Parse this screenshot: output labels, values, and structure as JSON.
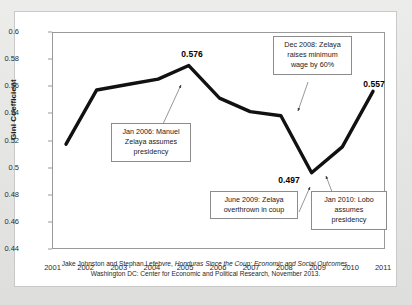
{
  "chart_data": {
    "type": "line",
    "title": "",
    "xlabel": "",
    "ylabel": "Gini Coefficient",
    "x": [
      2001,
      2002,
      2003,
      2004,
      2005,
      2006,
      2007,
      2008,
      2009,
      2010,
      2011
    ],
    "categories": [
      "2001",
      "2002",
      "2003",
      "2004",
      "2005",
      "2006",
      "2007",
      "2008",
      "2009",
      "2010",
      "2011"
    ],
    "values": [
      0.518,
      0.558,
      0.562,
      0.566,
      0.576,
      0.552,
      0.542,
      0.539,
      0.497,
      0.516,
      0.557
    ],
    "series": [
      {
        "name": "Gini Coefficient",
        "values": [
          0.518,
          0.558,
          0.562,
          0.566,
          0.576,
          0.552,
          0.542,
          0.539,
          0.497,
          0.516,
          0.557
        ]
      }
    ],
    "ylim": [
      0.44,
      0.6
    ],
    "xlim": [
      2001,
      2011
    ],
    "ytick_labels": [
      "0.6",
      "0.58",
      "0.56",
      "0.54",
      "0.52",
      "0.5",
      "0.48",
      "0.46",
      "0.44"
    ],
    "ytick_values": [
      0.6,
      0.58,
      0.56,
      0.54,
      0.52,
      0.5,
      0.48,
      0.46,
      0.44
    ],
    "grid": false,
    "legend": "none",
    "line_color": "#111111",
    "data_labels": [
      {
        "text": "0.576",
        "x": 2005,
        "y": 0.576
      },
      {
        "text": "0.497",
        "x": 2009,
        "y": 0.497
      },
      {
        "text": "0.557",
        "x": 2011,
        "y": 0.557
      }
    ],
    "annotations": [
      {
        "id": "jan-2006",
        "text": "Jan 2006: Manuel Zelaya assumes presidency",
        "points_to_x": 2005.15,
        "points_to_y": 0.5705
      },
      {
        "id": "dec-2008",
        "text": "Dec 2008: Zelaya raises minimum wage by 60%",
        "points_to_x": 2008.25,
        "points_to_y": 0.5355
      },
      {
        "id": "june-2009",
        "text": "June 2009: Zelaya overthrown in coup",
        "points_to_x": 2008.88,
        "points_to_y": 0.4985
      },
      {
        "id": "jan-2010",
        "text": "Jan 2010: Lobo assumes presidency",
        "points_to_x": 2009.55,
        "points_to_y": 0.5055
      }
    ]
  },
  "annotations": {
    "jan2006": {
      "line1": "Jan 2006: Manuel",
      "line2": "Zelaya assumes",
      "line3": "presidency"
    },
    "dec2008": {
      "line1": "Dec 2008: Zelaya",
      "line2": "raises minimum",
      "line3": "wage by 60%"
    },
    "june2009": {
      "line1": "June 2009: Zelaya",
      "line2": "overthrown in coup"
    },
    "jan2010": {
      "line1": "Jan 2010: Lobo",
      "line2": "assumes",
      "line3": "presidency"
    }
  },
  "caption": {
    "line1_a": "Jake Johnston and Stephan Lefebvre, ",
    "line1_b": "Honduras Since the Coup: Economic and Social Outcomes",
    "line1_c": ".",
    "line2": "Washington DC: Center for Economic and Political Research, November 2013."
  },
  "colors": {
    "line": "#111111",
    "axis": "#9a9a9a",
    "text": "#1a1a1a",
    "card_background": "#ffffff",
    "page_background": "#e9e9e7"
  }
}
